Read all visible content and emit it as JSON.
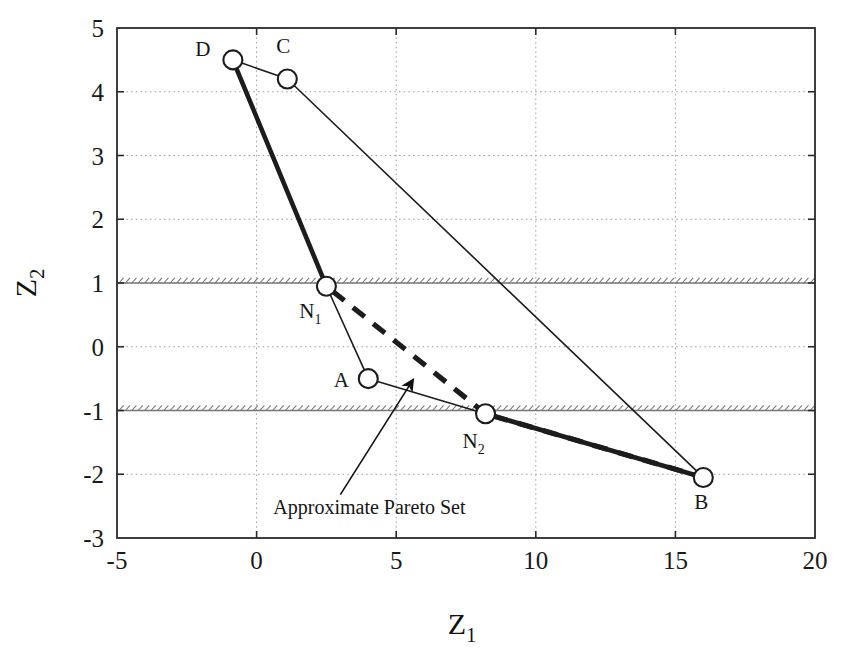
{
  "chart_data": {
    "type": "scatter",
    "title": "",
    "xlabel": "Z1",
    "xlabel_base": "Z",
    "xlabel_sub": "1",
    "ylabel": "Z2",
    "ylabel_base": "Z",
    "ylabel_sub": "2",
    "xlim": [
      -5,
      20
    ],
    "ylim": [
      -3,
      5
    ],
    "xticks": [
      "-5",
      "0",
      "5",
      "10",
      "15",
      "20"
    ],
    "xtick_values": [
      -5,
      0,
      5,
      10,
      15,
      20
    ],
    "yticks": [
      "5",
      "4",
      "3",
      "2",
      "1",
      "0",
      "-1",
      "-2",
      "-3"
    ],
    "ytick_values": [
      5,
      4,
      3,
      2,
      1,
      0,
      -1,
      -2,
      -3
    ],
    "grid": true,
    "grid_style": "dotted",
    "legend": "none",
    "points": [
      {
        "label": "D",
        "label_base": "D",
        "label_sub": "",
        "x": -0.85,
        "y": 4.5,
        "label_dx": -30,
        "label_dy": -4
      },
      {
        "label": "C",
        "label_base": "C",
        "label_sub": "",
        "x": 1.1,
        "y": 4.2,
        "label_dx": -4,
        "label_dy": -26
      },
      {
        "label": "N1",
        "label_base": "N",
        "label_sub": "1",
        "x": 2.5,
        "y": 0.95,
        "label_dx": -16,
        "label_dy": 32
      },
      {
        "label": "A",
        "label_base": "A",
        "label_sub": "",
        "x": 4.0,
        "y": -0.5,
        "label_dx": -27,
        "label_dy": 8
      },
      {
        "label": "N2",
        "label_base": "N",
        "label_sub": "2",
        "x": 8.2,
        "y": -1.05,
        "label_dx": -12,
        "label_dy": 34
      },
      {
        "label": "B",
        "label_base": "B",
        "label_sub": "",
        "x": 16.0,
        "y": -2.05,
        "label_dx": -2,
        "label_dy": 32
      }
    ],
    "edges": [
      {
        "from": "D",
        "to": "C",
        "weight": "thin"
      },
      {
        "from": "D",
        "to": "N1",
        "weight": "thick"
      },
      {
        "from": "N1",
        "to": "A",
        "weight": "thin"
      },
      {
        "from": "C",
        "to": "B",
        "weight": "thin"
      },
      {
        "from": "A",
        "to": "N2",
        "weight": "thin"
      },
      {
        "from": "N2",
        "to": "B",
        "weight": "thick"
      }
    ],
    "pareto_set": {
      "name": "Approximate Pareto Set",
      "style": "dashed",
      "path": [
        "N1",
        "N2",
        "B"
      ]
    },
    "constraints": [
      {
        "name": "upper-constraint",
        "y": 1.0,
        "hatch_side": "above"
      },
      {
        "name": "lower-constraint",
        "y": -1.0,
        "hatch_side": "above"
      }
    ],
    "annotations": [
      {
        "text": "Approximate Pareto Set",
        "text_x": 0.6,
        "text_y": -2.62,
        "leader_from": [
          3.0,
          -2.32
        ],
        "leader_to": [
          5.6,
          -0.52
        ]
      }
    ],
    "colors": {
      "background": "#ffffff",
      "axis": "#2a2a2a",
      "grid": "#9a9a9a",
      "line": "#1c1c1c",
      "marker_fill": "#ffffff",
      "marker_edge": "#1c1c1c",
      "constraint": "#777777"
    }
  }
}
